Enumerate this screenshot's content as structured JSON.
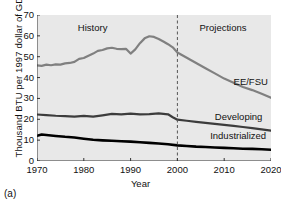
{
  "caption": "(a)",
  "chart_data": {
    "type": "line",
    "title": "",
    "xlabel": "Year",
    "ylabel": "Thousand BTU per 1997 dollar of GDP",
    "xlim": [
      1970,
      2020
    ],
    "ylim": [
      0,
      70
    ],
    "xticks": [
      1970,
      1980,
      1990,
      2000,
      2010,
      2020
    ],
    "yticks": [
      0,
      10,
      20,
      30,
      40,
      50,
      60,
      70
    ],
    "grid": false,
    "legend": "inline-right-labels",
    "plot_background": "#e8e8e8",
    "annotations": [
      {
        "text": "History",
        "x": 1983,
        "y": 64,
        "name": "history-annotation"
      },
      {
        "text": "Projections",
        "x": 2009,
        "y": 64,
        "name": "projections-annotation"
      }
    ],
    "divider": {
      "x": 2000,
      "style": "dashed",
      "label": "history-projection-divider"
    },
    "series": [
      {
        "name": "EE/FSU",
        "color": "#808080",
        "width": 2.2,
        "label_x": 2012,
        "label_y": 38,
        "x": [
          1970,
          1971,
          1972,
          1973,
          1974,
          1975,
          1976,
          1977,
          1978,
          1979,
          1980,
          1981,
          1982,
          1983,
          1984,
          1985,
          1986,
          1987,
          1988,
          1989,
          1990,
          1991,
          1992,
          1993,
          1994,
          1995,
          1996,
          1997,
          1998,
          1999,
          2000,
          2002,
          2004,
          2006,
          2008,
          2010,
          2012,
          2014,
          2016,
          2018,
          2020
        ],
        "y": [
          45.8,
          45.6,
          46.2,
          45.9,
          46.3,
          46.2,
          46.8,
          47.0,
          47.5,
          49.0,
          49.4,
          50.5,
          51.5,
          52.8,
          53.2,
          54.0,
          54.3,
          53.8,
          53.6,
          53.8,
          51.5,
          53.5,
          56.5,
          58.8,
          59.8,
          59.5,
          58.5,
          57.3,
          56.0,
          54.5,
          52.0,
          49.5,
          47.0,
          44.5,
          42.0,
          39.5,
          37.5,
          35.5,
          34.0,
          32.2,
          30.3
        ]
      },
      {
        "name": "Developing",
        "color": "#3c3c3c",
        "width": 2.2,
        "label_x": 2008,
        "label_y": 21,
        "x": [
          1970,
          1972,
          1974,
          1976,
          1978,
          1980,
          1982,
          1984,
          1986,
          1988,
          1990,
          1992,
          1994,
          1996,
          1998,
          1999,
          2000,
          2002,
          2004,
          2006,
          2008,
          2010,
          2012,
          2014,
          2016,
          2018,
          2020
        ],
        "y": [
          22.3,
          22.0,
          21.7,
          21.5,
          21.3,
          21.6,
          21.3,
          21.9,
          22.6,
          22.4,
          22.7,
          22.4,
          22.5,
          22.8,
          22.4,
          21.0,
          19.8,
          19.3,
          18.8,
          18.3,
          17.8,
          17.3,
          16.8,
          16.3,
          15.8,
          15.2,
          14.6
        ]
      },
      {
        "name": "Industrialized",
        "color": "#000000",
        "width": 2.6,
        "label_x": 2007,
        "label_y": 12,
        "x": [
          1970,
          1971,
          1972,
          1974,
          1976,
          1978,
          1980,
          1982,
          1984,
          1986,
          1988,
          1990,
          1992,
          1994,
          1996,
          1998,
          2000,
          2002,
          2004,
          2006,
          2008,
          2010,
          2012,
          2014,
          2016,
          2018,
          2020
        ],
        "y": [
          12.1,
          12.7,
          12.5,
          12.0,
          11.6,
          11.3,
          10.7,
          10.2,
          9.9,
          9.7,
          9.5,
          9.3,
          9.0,
          8.7,
          8.4,
          8.0,
          7.5,
          7.2,
          6.9,
          6.7,
          6.5,
          6.3,
          6.1,
          5.9,
          5.8,
          5.6,
          5.4
        ]
      }
    ]
  }
}
